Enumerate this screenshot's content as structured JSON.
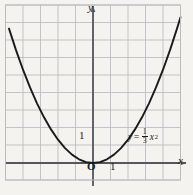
{
  "figure": {
    "title": "",
    "background_color": "#f4f3ef",
    "grid_color": "#b9bcc4",
    "axis_color": "#55575c",
    "curve_color": "#1a1a1a"
  },
  "labels": {
    "y_axis": "y",
    "x_axis": "x",
    "origin": "O",
    "x_tick_1": "1",
    "y_tick_1": "1"
  },
  "equation": {
    "lhs": "y",
    "equals": "=",
    "numerator": "1",
    "denominator": "3",
    "variable": "x",
    "exponent": "2",
    "plain": "y = (1/3)x²"
  },
  "chart_data": {
    "type": "line",
    "title": "",
    "xlabel": "x",
    "ylabel": "y",
    "grid": true,
    "legend": "inline-annotation",
    "annotations": [
      {
        "text": "y = (1/3)x²",
        "x": 2.4,
        "y": 1.6
      },
      {
        "text": "O",
        "x": 0,
        "y": 0
      },
      {
        "text": "1",
        "x": 1,
        "y": 0
      },
      {
        "text": "1",
        "x": 0,
        "y": 1
      }
    ],
    "xlim": [
      -4.9,
      5.9
    ],
    "ylim": [
      -1.1,
      9.1
    ],
    "xticks": [
      -4,
      -3,
      -2,
      -1,
      0,
      1,
      2,
      3,
      4,
      5
    ],
    "yticks": [
      -1,
      0,
      1,
      2,
      3,
      4,
      5,
      6,
      7,
      8,
      9
    ],
    "series": [
      {
        "name": "y = (1/3)x²",
        "equation": "y = x^2/3",
        "color": "#1a1a1a",
        "x": [
          -4.8,
          -4.4,
          -4.0,
          -3.6,
          -3.2,
          -2.8,
          -2.4,
          -2.0,
          -1.6,
          -1.2,
          -0.8,
          -0.4,
          0.0,
          0.4,
          0.8,
          1.2,
          1.6,
          2.0,
          2.4,
          2.8,
          3.2,
          3.6,
          4.0,
          4.4,
          4.8,
          5.0
        ],
        "y": [
          7.68,
          6.45,
          5.33,
          4.32,
          3.41,
          2.61,
          1.92,
          1.33,
          0.85,
          0.48,
          0.21,
          0.05,
          0.0,
          0.05,
          0.21,
          0.48,
          0.85,
          1.33,
          1.92,
          2.61,
          3.41,
          4.32,
          5.33,
          6.45,
          7.68,
          8.33
        ]
      }
    ]
  }
}
